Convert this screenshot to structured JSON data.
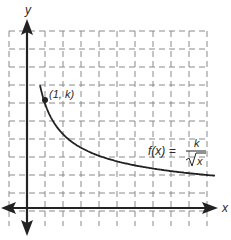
{
  "chart_data": {
    "type": "line",
    "title": "",
    "xlabel": "x",
    "ylabel": "y",
    "function_label": {
      "lhs": "f(x) =",
      "numerator": "k",
      "denominator": "√x"
    },
    "point_label": "(1, k)",
    "point": {
      "x": 1,
      "y": "k"
    },
    "grid": true,
    "grid_style": "dashed",
    "unit_px": 18,
    "xlim": [
      -1,
      10
    ],
    "ylim": [
      -1,
      10
    ],
    "k_estimate": 6,
    "series": [
      {
        "name": "f(x) = k/√x",
        "x": [
          0.7,
          1,
          2,
          3,
          4,
          5,
          6,
          7,
          8,
          9,
          10.2
        ],
        "y": [
          7.2,
          6.0,
          4.2,
          3.5,
          3.0,
          2.7,
          2.4,
          2.3,
          2.1,
          2.0,
          1.9
        ]
      }
    ]
  },
  "labels": {
    "y_axis": "y",
    "x_axis": "x",
    "point": "(1, k)",
    "func_lhs": "f(x) =",
    "func_num": "k",
    "func_den": "x"
  }
}
